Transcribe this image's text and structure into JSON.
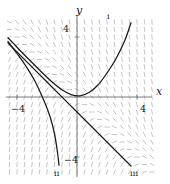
{
  "figure": {
    "name": "slope-field-with-solution-curves",
    "background": "#ffffff",
    "width": 170,
    "height": 184
  },
  "axes": {
    "x_label": "x",
    "y_label": "y",
    "axis_color": "#6e6e6e",
    "ticks": {
      "x_left": "−4",
      "x_right": "4",
      "y_top": "4",
      "y_bottom": "−4"
    }
  },
  "curve_labels": {
    "i": "i",
    "ii": "ii",
    "iii": "iii"
  },
  "styles": {
    "slope_mark_color": "#b9b9c4",
    "curve_color": "#1a1a1a"
  },
  "chart_data": {
    "type": "line",
    "title": "",
    "subtitle": "",
    "xlabel": "x",
    "ylabel": "y",
    "xlim": [
      -5.2,
      5.2
    ],
    "ylim": [
      -5.2,
      5.2
    ],
    "grid": false,
    "legend": "none",
    "xticks": [
      -4,
      4
    ],
    "xticklabels": [
      "−4",
      "4"
    ],
    "yticks": [
      -4,
      4
    ],
    "yticklabels": [
      "−4",
      "4"
    ],
    "slope_field": {
      "description": "direction field of dy/dx = -y - x, short dashes on a lattice",
      "x_range": [
        -5,
        5
      ],
      "y_range": [
        -5,
        5
      ],
      "step": 0.5,
      "formula": "dy/dx = -y - x",
      "mark_length": 4.5,
      "color": "#b9b9c4"
    },
    "series": [
      {
        "name": "i",
        "label": "i",
        "annotation": "i",
        "annotation_at": [
          3.6,
          5.0
        ],
        "comment": "solution rising steeply on the right, minimum near x = -1, asymptotic to y = -x-1 from above on the left",
        "x": [
          -4.6,
          -4.0,
          -3.4,
          -2.8,
          -2.2,
          -1.6,
          -1.0,
          -0.4,
          0.2,
          0.8,
          1.4,
          2.0,
          2.6,
          3.2,
          3.6
        ],
        "y": [
          3.95,
          3.32,
          2.7,
          2.1,
          1.5,
          0.95,
          0.48,
          0.16,
          0.08,
          0.3,
          0.8,
          1.6,
          2.55,
          3.8,
          4.95
        ]
      },
      {
        "name": "ii",
        "label": "ii",
        "annotation": "ii",
        "annotation_at": [
          -1.2,
          -4.9
        ],
        "comment": "solution falling steeply downward, leaves the window near the bottom left",
        "x": [
          -4.6,
          -4.0,
          -3.4,
          -2.8,
          -2.2,
          -1.8,
          -1.5,
          -1.3,
          -1.2
        ],
        "y": [
          3.7,
          2.9,
          2.05,
          1.05,
          -0.25,
          -1.3,
          -2.45,
          -3.7,
          -4.55
        ]
      },
      {
        "name": "iii",
        "label": "iii",
        "annotation": "iii",
        "annotation_at": [
          3.4,
          -4.9
        ],
        "comment": "the straight-line separatrix solution y = -x - 1",
        "x": [
          -4.6,
          -2.0,
          0.0,
          2.0,
          3.6
        ],
        "y": [
          3.6,
          1.0,
          -1.0,
          -3.0,
          -4.6
        ]
      }
    ]
  }
}
